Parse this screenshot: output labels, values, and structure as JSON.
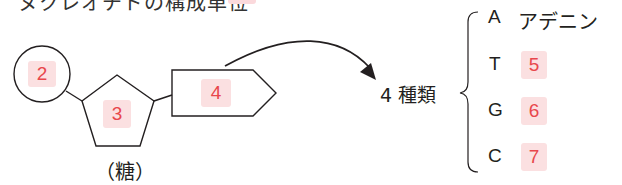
{
  "header": {
    "title_partial": "ヌクレオチドの構成単位",
    "answer_box_partial": ""
  },
  "nucleotide": {
    "phosphate_answer": "2",
    "sugar_answer": "3",
    "base_answer": "4",
    "sugar_caption": "（糖）"
  },
  "bases": {
    "count_label": "4 種類",
    "items": [
      {
        "letter": "A",
        "name": "アデニン",
        "answer": ""
      },
      {
        "letter": "T",
        "name": "",
        "answer": "5"
      },
      {
        "letter": "G",
        "name": "",
        "answer": "6"
      },
      {
        "letter": "C",
        "name": "",
        "answer": "7"
      }
    ]
  },
  "colors": {
    "answer_bg": "#fbe0e1",
    "answer_text": "#e8474c",
    "line": "#231f20"
  }
}
